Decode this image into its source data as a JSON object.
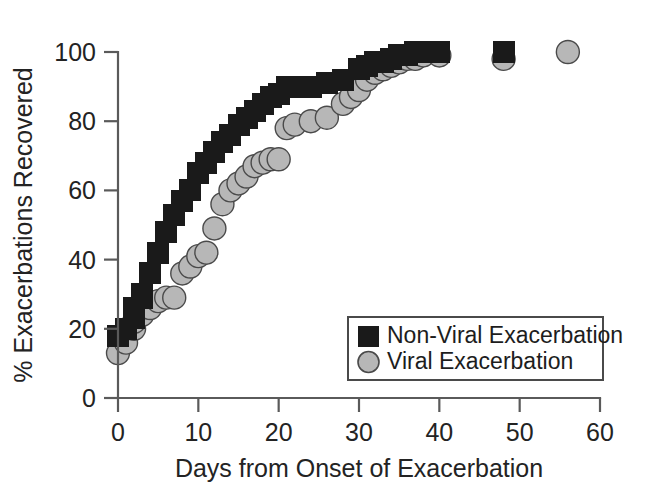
{
  "chart_data": {
    "type": "scatter",
    "title": "",
    "xlabel": "Days from Onset of Exacerbation",
    "ylabel": "% Exacerbations Recovered",
    "xlim": [
      0,
      60
    ],
    "ylim": [
      0,
      100
    ],
    "xticks": [
      0,
      10,
      20,
      30,
      40,
      50,
      60
    ],
    "yticks": [
      0,
      20,
      40,
      60,
      80,
      100
    ],
    "xtick_labels": [
      "0",
      "10",
      "20",
      "30",
      "40",
      "50",
      "60"
    ],
    "ytick_labels": [
      "0",
      "20",
      "40",
      "60",
      "80",
      "100"
    ],
    "grid": false,
    "legend_position": "inside-lower-right",
    "series": [
      {
        "name": "Non-Viral Exacerbation",
        "marker": "square",
        "color": "#1a1a1a",
        "edge_color": "#1a1a1a",
        "points": [
          [
            0,
            18
          ],
          [
            1,
            20
          ],
          [
            2,
            23
          ],
          [
            2,
            26
          ],
          [
            3,
            29
          ],
          [
            3,
            30
          ],
          [
            4,
            36
          ],
          [
            5,
            42
          ],
          [
            6,
            48
          ],
          [
            7,
            53
          ],
          [
            8,
            57
          ],
          [
            9,
            60
          ],
          [
            10,
            65
          ],
          [
            11,
            68
          ],
          [
            12,
            71
          ],
          [
            13,
            74
          ],
          [
            14,
            76
          ],
          [
            15,
            79
          ],
          [
            16,
            81
          ],
          [
            17,
            83
          ],
          [
            18,
            85
          ],
          [
            19,
            87
          ],
          [
            20,
            88
          ],
          [
            21,
            90
          ],
          [
            22,
            90
          ],
          [
            24,
            90
          ],
          [
            26,
            91
          ],
          [
            28,
            92
          ],
          [
            30,
            95
          ],
          [
            31,
            96
          ],
          [
            32,
            97
          ],
          [
            33,
            97
          ],
          [
            34,
            98
          ],
          [
            35,
            99
          ],
          [
            36,
            99
          ],
          [
            37,
            100
          ],
          [
            38,
            100
          ],
          [
            40,
            100
          ],
          [
            48,
            100
          ]
        ]
      },
      {
        "name": "Viral Exacerbation",
        "marker": "circle",
        "color": "#b7b7b7",
        "edge_color": "#4a4a4a",
        "points": [
          [
            0,
            13
          ],
          [
            1,
            16
          ],
          [
            2,
            20
          ],
          [
            2,
            22
          ],
          [
            3,
            24
          ],
          [
            4,
            26
          ],
          [
            5,
            28
          ],
          [
            6,
            29
          ],
          [
            7,
            29
          ],
          [
            8,
            36
          ],
          [
            9,
            38
          ],
          [
            10,
            41
          ],
          [
            11,
            42
          ],
          [
            12,
            49
          ],
          [
            13,
            56
          ],
          [
            14,
            60
          ],
          [
            15,
            62
          ],
          [
            16,
            64
          ],
          [
            17,
            67
          ],
          [
            18,
            68
          ],
          [
            19,
            69
          ],
          [
            20,
            69
          ],
          [
            21,
            78
          ],
          [
            22,
            79
          ],
          [
            24,
            80
          ],
          [
            26,
            81
          ],
          [
            28,
            85
          ],
          [
            29,
            87
          ],
          [
            30,
            89
          ],
          [
            31,
            92
          ],
          [
            32,
            94
          ],
          [
            33,
            95
          ],
          [
            34,
            96
          ],
          [
            35,
            97
          ],
          [
            36,
            98
          ],
          [
            37,
            98
          ],
          [
            38,
            99
          ],
          [
            40,
            99
          ],
          [
            48,
            98
          ],
          [
            56,
            100
          ]
        ]
      }
    ]
  },
  "legend": {
    "entries": [
      {
        "label": "Non-Viral Exacerbation",
        "marker": "square",
        "color": "#1a1a1a"
      },
      {
        "label": "Viral Exacerbation",
        "marker": "circle",
        "color": "#b7b7b7"
      }
    ]
  }
}
